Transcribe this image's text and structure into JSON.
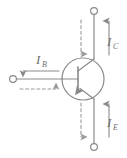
{
  "diagram": {
    "type": "circuit-schematic",
    "device": "PNP transistor",
    "background_color": "#ffffff",
    "stroke_color": "#8a8a8a",
    "label_color": "#6f6f6f",
    "terminals": [
      {
        "id": "collector",
        "position": "top",
        "marker": "open-circle"
      },
      {
        "id": "base",
        "position": "left",
        "marker": "open-circle"
      },
      {
        "id": "emitter",
        "position": "bottom",
        "marker": "open-circle"
      }
    ],
    "labels": {
      "collector_current": {
        "symbol": "I",
        "subscript": "C"
      },
      "base_current": {
        "symbol": "I",
        "subscript": "B"
      },
      "emitter_current": {
        "symbol": "I",
        "subscript": "E"
      }
    },
    "arrows": {
      "collector_conventional": {
        "style": "solid",
        "direction": "up",
        "label": "I_C"
      },
      "collector_electron": {
        "style": "dashed",
        "direction": "down",
        "label": ""
      },
      "emitter_conventional": {
        "style": "solid",
        "direction": "up",
        "label": "I_E"
      },
      "emitter_electron": {
        "style": "dashed",
        "direction": "down",
        "label": ""
      },
      "base_conventional": {
        "style": "solid",
        "direction": "left",
        "label": "I_B"
      },
      "base_electron": {
        "style": "dashed",
        "direction": "right",
        "label": ""
      },
      "emitter_junction": {
        "style": "solid",
        "direction": "into-base",
        "label": ""
      }
    }
  }
}
